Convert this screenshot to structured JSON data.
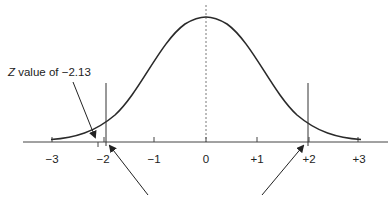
{
  "diagram": {
    "type": "normal-distribution-curve",
    "axis": {
      "tick_labels": [
        "−3",
        "−2",
        "−1",
        "0",
        "+1",
        "+2",
        "+3"
      ],
      "tick_values": [
        -3,
        -2,
        -1,
        0,
        1,
        2,
        3
      ]
    },
    "annotation": {
      "z_prefix": "Z",
      "text": " value of −2.13",
      "z_value": -2.13
    },
    "critical_lines": [
      -2,
      2
    ],
    "colors": {
      "curve": "#2a2a2a",
      "axis": "#444444",
      "text": "#222222",
      "background": "#ffffff"
    }
  }
}
